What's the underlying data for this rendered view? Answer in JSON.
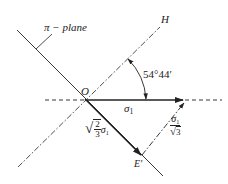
{
  "diagram": {
    "labels": {
      "pi_plane": "π − plane",
      "H": "H",
      "angle": "54°44′",
      "origin": "O",
      "sigma1": "σ",
      "sigma1_sub": "1",
      "E_prime": "E′",
      "projection_coef_num": "2",
      "projection_coef_den": "3",
      "projection_sigma": "σ",
      "projection_sigma_sub": "1",
      "normal_num_sigma": "σ",
      "normal_num_sub": "1",
      "normal_den": "3"
    },
    "colors": {
      "line": "#222222",
      "background": "#ffffff"
    }
  }
}
